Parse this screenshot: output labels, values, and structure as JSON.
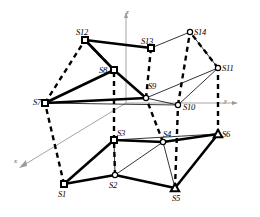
{
  "figure": {
    "kind": "3d-node-network-diagram",
    "background_color": "#ffffff",
    "line_color": "#000000",
    "axis_color": "#9a9a9a",
    "width": 260,
    "height": 217
  },
  "axes": [
    {
      "name": "z",
      "label": "z",
      "label_x": 126,
      "label_y": 9,
      "direction": "up"
    },
    {
      "name": "y",
      "label": "y",
      "label_x": 224,
      "label_y": 98,
      "direction": "right"
    },
    {
      "name": "x",
      "label": "x",
      "label_x": 14,
      "label_y": 158,
      "direction": "down-left"
    }
  ],
  "nodes": [
    {
      "id": "S1",
      "label": "S1",
      "x": 64,
      "y": 184,
      "marker": "square",
      "label_x": 58,
      "label_y": 190
    },
    {
      "id": "S2",
      "label": "S2",
      "x": 115,
      "y": 175,
      "marker": "circle",
      "label_x": 109,
      "label_y": 181
    },
    {
      "id": "S3",
      "label": "S3",
      "x": 114,
      "y": 140,
      "marker": "square",
      "label_x": 117,
      "label_y": 129
    },
    {
      "id": "S4",
      "label": "S4",
      "x": 163,
      "y": 142,
      "marker": "circle",
      "label_x": 163,
      "label_y": 130
    },
    {
      "id": "S5",
      "label": "S5",
      "x": 175,
      "y": 188,
      "marker": "triangle",
      "label_x": 172,
      "label_y": 194
    },
    {
      "id": "S6",
      "label": "S6",
      "x": 218,
      "y": 134,
      "marker": "triangle",
      "label_x": 222,
      "label_y": 130
    },
    {
      "id": "S7",
      "label": "S7",
      "x": 45,
      "y": 103,
      "marker": "square",
      "label_x": 33,
      "label_y": 98
    },
    {
      "id": "S8",
      "label": "S8",
      "x": 114,
      "y": 70,
      "marker": "square",
      "label_x": 99,
      "label_y": 66
    },
    {
      "id": "S9",
      "label": "S9",
      "x": 146,
      "y": 98,
      "marker": "circle",
      "label_x": 148,
      "label_y": 82
    },
    {
      "id": "S10",
      "label": "S10",
      "x": 178,
      "y": 105,
      "marker": "circle",
      "label_x": 183,
      "label_y": 103
    },
    {
      "id": "S11",
      "label": "S11",
      "x": 218,
      "y": 68,
      "marker": "circle",
      "label_x": 222,
      "label_y": 64
    },
    {
      "id": "S12",
      "label": "S12",
      "x": 85,
      "y": 40,
      "marker": "square",
      "label_x": 76,
      "label_y": 28
    },
    {
      "id": "S13",
      "label": "S13",
      "x": 151,
      "y": 48,
      "marker": "square",
      "label_x": 141,
      "label_y": 37
    },
    {
      "id": "S14",
      "label": "S14",
      "x": 190,
      "y": 32,
      "marker": "circle",
      "label_x": 194,
      "label_y": 28
    }
  ],
  "edges_solid_thick": [
    {
      "from": "S1",
      "to": "S2"
    },
    {
      "from": "S1",
      "to": "S3"
    },
    {
      "from": "S2",
      "to": "S5"
    },
    {
      "from": "S3",
      "to": "S4"
    },
    {
      "from": "S5",
      "to": "S6"
    },
    {
      "from": "S4",
      "to": "S6"
    },
    {
      "from": "S7",
      "to": "S8"
    },
    {
      "from": "S7",
      "to": "S9"
    },
    {
      "from": "S8",
      "to": "S9"
    },
    {
      "from": "S12",
      "to": "S13"
    },
    {
      "from": "S8",
      "to": "S12"
    }
  ],
  "edges_solid_thin": [
    {
      "from": "S2",
      "to": "S3"
    },
    {
      "from": "S2",
      "to": "S4"
    },
    {
      "from": "S3",
      "to": "S6"
    },
    {
      "from": "S4",
      "to": "S5"
    },
    {
      "from": "S7",
      "to": "S10"
    },
    {
      "from": "S9",
      "to": "S11"
    },
    {
      "from": "S10",
      "to": "S11"
    },
    {
      "from": "S9",
      "to": "S10"
    },
    {
      "from": "S13",
      "to": "S14"
    },
    {
      "from": "S14",
      "to": "S11"
    }
  ],
  "edges_dashed": [
    {
      "from": "S1",
      "to": "S7"
    },
    {
      "from": "S2",
      "to": "S3"
    },
    {
      "from": "S3",
      "to": "S8"
    },
    {
      "from": "S4",
      "to": "S9"
    },
    {
      "from": "S5",
      "to": "S10"
    },
    {
      "from": "S6",
      "to": "S11"
    },
    {
      "from": "S7",
      "to": "S12"
    },
    {
      "from": "S8",
      "to": "S12"
    },
    {
      "from": "S9",
      "to": "S13"
    },
    {
      "from": "S10",
      "to": "S14"
    },
    {
      "from": "S11",
      "to": "S14"
    }
  ]
}
